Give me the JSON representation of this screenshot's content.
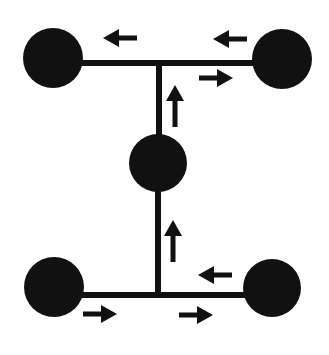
{
  "diagram": {
    "type": "flow-network",
    "colors": {
      "fill": "#111111",
      "background": "#ffffff"
    },
    "nodes": [
      {
        "id": "top-left",
        "cx": 53,
        "cy": 58,
        "r": 30
      },
      {
        "id": "top-right",
        "cx": 282,
        "cy": 59,
        "r": 30
      },
      {
        "id": "middle",
        "cx": 158,
        "cy": 163,
        "r": 29
      },
      {
        "id": "bottom-left",
        "cx": 54,
        "cy": 287,
        "r": 30
      },
      {
        "id": "bottom-right",
        "cx": 272,
        "cy": 288,
        "r": 29
      }
    ],
    "edges": [
      {
        "id": "top-bar",
        "x1": 80,
        "y1": 63,
        "x2": 255,
        "y2": 63
      },
      {
        "id": "upper-stem",
        "x1": 159,
        "y1": 63,
        "x2": 159,
        "y2": 140
      },
      {
        "id": "lower-stem",
        "x1": 158,
        "y1": 188,
        "x2": 158,
        "y2": 295
      },
      {
        "id": "bottom-bar",
        "x1": 80,
        "y1": 295,
        "x2": 246,
        "y2": 295
      }
    ],
    "arrows": [
      {
        "id": "top-left-arrow",
        "direction": "left",
        "x": 103,
        "y": 38
      },
      {
        "id": "top-right-arrow",
        "direction": "left",
        "x": 213,
        "y": 39
      },
      {
        "id": "top-right-out-arrow",
        "direction": "right",
        "x": 199,
        "y": 78
      },
      {
        "id": "upper-stem-arrow",
        "direction": "up",
        "x": 175,
        "y": 85
      },
      {
        "id": "lower-stem-arrow",
        "direction": "up",
        "x": 173,
        "y": 220
      },
      {
        "id": "bottom-right-in-arrow",
        "direction": "left",
        "x": 198,
        "y": 275
      },
      {
        "id": "bottom-left-arrow",
        "direction": "right",
        "x": 83,
        "y": 314
      },
      {
        "id": "bottom-right-arrow",
        "direction": "right",
        "x": 179,
        "y": 315
      }
    ]
  }
}
